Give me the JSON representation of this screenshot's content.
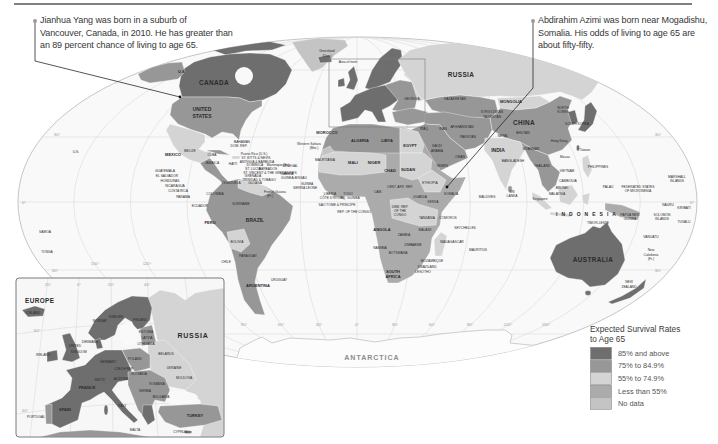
{
  "callouts": [
    {
      "lines": [
        "Jianhua Yang was born in a suburb of",
        "Vancouver, Canada, in 2010. He has greater than",
        "an 89 percent chance of living to age 65."
      ]
    },
    {
      "lines": [
        "Abdirahim Azimi was born near Mogadishu,",
        "Somalia. His odds of living to age 65 are",
        "about fifty-fifty."
      ]
    }
  ],
  "legend": {
    "title_line1": "Expected Survival Rates",
    "title_line2": "to Age 65",
    "items": [
      {
        "label": "85% and above",
        "color": "#6e6e6e"
      },
      {
        "label": "75% to 84.9%",
        "color": "#979797"
      },
      {
        "label": "55% to 74.9%",
        "color": "#d4d4d4"
      },
      {
        "label": "Less than 55%",
        "color": "#ababab"
      },
      {
        "label": "No data",
        "color": "#c4c4c4"
      }
    ]
  },
  "map": {
    "degree_labels": [
      "30°",
      "0°",
      "30°",
      "150°",
      "120°",
      "30°",
      "0°",
      "30°",
      "90°",
      "60°",
      "30°",
      "0°",
      "30°",
      "60°",
      "90°",
      "120°",
      "150°"
    ],
    "labels": {
      "us_alaska": "U.S.",
      "us_hawaii": "U.S.",
      "canada": "CANADA",
      "united_states_1": "UNITED",
      "united_states_2": "STATES",
      "greenland_1": "Greenland",
      "greenland_2": "(Den.)",
      "area_of_inset": "Area of inset",
      "mexico": "MEXICO",
      "belize": "BELIZE",
      "cuba": "CUBA",
      "bahamas": "BAHAMAS",
      "dom_rep": "DOM. REP.",
      "jamaica": "JAMAICA",
      "haiti": "HAITI",
      "puerto_rico": "Puerto Rico (U.S.)",
      "st_kitts": "ST. KITTS & NEVIS",
      "antigua": "ANTIGUA & BARBUDA",
      "dominica": "DOMINICA",
      "martinique": "Martinique (Fr.)",
      "st_lucia": "ST. LUCIA",
      "barbados": "BARBADOS",
      "st_vincent": "ST. VINCENT & THE GRENADINES",
      "grenada": "GRENADA",
      "trinidad": "TRINIDAD & TOBAGO",
      "guatemala": "GUATEMALA",
      "el_salvador": "EL SALVADOR",
      "honduras": "HONDURAS",
      "nicaragua": "NICARAGUA",
      "costa_rica": "COSTA RICA",
      "panama": "PANAMA",
      "colombia": "COLOMBIA",
      "ecuador": "ECUADOR",
      "venezuela": "VENEZUELA",
      "guyana": "GUYANA",
      "suriname": "SURINAME",
      "french_guiana_1": "French Guiana",
      "french_guiana_2": "(Fr.)",
      "peru": "PERU",
      "brazil": "BRAZIL",
      "bolivia": "BOLIVIA",
      "paraguay": "PARAGUAY",
      "chile": "CHILE",
      "uruguay": "URUGUAY",
      "argentina": "ARGENTINA",
      "samoa": "SAMOA",
      "tonga": "TONGA",
      "morocco": "MOROCCO",
      "western_sahara_1": "Western Sahara",
      "western_sahara_2": "(Mor.)",
      "algeria": "ALGERIA",
      "libya": "LIBYA",
      "egypt": "EGYPT",
      "mauritania": "MAURITANIA",
      "mali": "MALI",
      "niger": "NIGER",
      "chad": "CHAD",
      "sudan": "SUDAN",
      "senegal": "SENEGAL",
      "gambia": "GAMBIA",
      "guinea_bissau": "GUINEA-BISSAU",
      "guinea": "GUINEA",
      "sierra_leone": "SIERRA LEONE",
      "liberia": "LIBERIA",
      "cote_divoire": "CÔTE D'IVOIRE",
      "togo": "TOGO",
      "eq_guinea": "EQ. GUINEA",
      "sao_tome": "SAO TOME & PRINCIPE",
      "rep_congo": "REP. OF THE CONGO",
      "cameroon": "CAM.",
      "car": "CENT. AFR. REP.",
      "ethiopia": "ETHIOPIA",
      "somalia": "SOMALIA",
      "uganda": "UGANDA",
      "kenya": "KENYA",
      "drc_1": "DEM. REP.",
      "drc_2": "OF THE",
      "drc_3": "CONGO",
      "tanzania": "TANZANIA",
      "angola": "ANGOLA",
      "zambia": "ZAMBIA",
      "malawi": "MALAWI",
      "namibia": "NAMIBIA",
      "botswana": "BOTSWANA",
      "zimbabwe": "ZIMBABWE",
      "south_africa_1": "SOUTH",
      "south_africa_2": "AFRICA",
      "mozambique": "MOZAMBIQUE",
      "swaziland": "SWAZILAND",
      "lesotho": "LESOTHO",
      "madagascar": "MADAGASCAR",
      "comoros": "COMOROS",
      "seychelles": "SEYCHELLES",
      "mauritius": "MAURITIUS",
      "georgia": "GEORGIA",
      "iraq": "IRAQ",
      "iran": "IRAN",
      "saudi_1": "SAUDI",
      "saudi_2": "ARABIA",
      "yemen": "YEMEN",
      "oman": "OMAN",
      "kazakhstan": "KAZAKHSTAN",
      "afghanistan": "AFGHANISTAN",
      "pakistan": "PAKISTAN",
      "kyrgyzstan": "KYRGYZSTAN",
      "tajikistan": "TAJIKISTAN",
      "mongolia": "MONGOLIA",
      "china": "CHINA",
      "nepal": "NEPAL",
      "bhutan": "BHUTAN",
      "india": "INDIA",
      "bangladesh": "BANGLADESH",
      "myanmar": "MYANMAR",
      "thailand": "THAILAND",
      "vietnam": "VIETNAM",
      "cambodia": "CAMBODIA",
      "brunei": "BRUNEI",
      "malaysia": "MALAYSIA",
      "singapore": "Singapore",
      "sri_lanka_1": "SRI",
      "sri_lanka_2": "LANKA",
      "maldives": "MALDIVES",
      "north_korea_1": "NORTH",
      "north_korea_2": "KOREA",
      "south_korea": "SOUTH KOREA",
      "hong_kong": "Hong Kong",
      "macau": "Macau",
      "taiwan": "Taiwan",
      "philippines": "PHILIPPINES",
      "palau": "PALAU",
      "micronesia_1": "FEDERATED STATES",
      "micronesia_2": "OF MICRONESIA",
      "marshall_1": "MARSHALL",
      "marshall_2": "ISLANDS",
      "nauru": "NAURU",
      "kiribati": "KIRIBATI",
      "indonesia": "INDONESIA",
      "png_1": "PAPUA NEW",
      "png_2": "GUINEA",
      "solomon_1": "SOLOMON",
      "solomon_2": "ISLANDS",
      "tuvalu": "TUVALU",
      "timor_leste": "TIMOR-LESTE",
      "vanuatu": "VANUATU",
      "new_caledonia_1": "New",
      "new_caledonia_2": "Caledonia",
      "new_caledonia_3": "(Fr.)",
      "australia": "AUSTRALIA",
      "new_zealand_1": "NEW",
      "new_zealand_2": "ZEALAND",
      "russia": "RUSSIA",
      "antarctica": "ANTARCTICA"
    }
  },
  "inset": {
    "degree_labels": [
      "20°",
      "0°",
      "20°",
      "40°",
      "60°",
      "40°"
    ],
    "labels": {
      "title": "EUROPE",
      "russia": "RUSSIA",
      "iceland": "ICELAND",
      "norway": "NORWAY",
      "sweden": "SWEDEN",
      "finland": "FINLAND",
      "estonia": "ESTONIA",
      "latvia": "LATVIA",
      "lithuania": "LITHUANIA",
      "denmark": "DENMARK",
      "united_kingdom_1": "UNITED",
      "united_kingdom_2": "KINGDOM",
      "ireland": "IRELAND",
      "germany": "GERMANY",
      "poland": "POLAND",
      "belarus": "BELARUS",
      "ukraine": "UKRAINE",
      "moldova": "MOLDOVA",
      "czech_rep": "CZECH REP.",
      "austria": "AUSTRIA",
      "slovakia": "SLOVAKIA",
      "romania": "ROMANIA",
      "switzerland": "SWITZ.",
      "france": "FRANCE",
      "serbia": "SERBIA",
      "bulgaria": "BULGARIA",
      "italy": "ITALY",
      "spain": "SPAIN",
      "portugal": "PORTUGAL",
      "turkey": "TURKEY",
      "malta": "MALTA",
      "cyprus": "CYPRUS"
    }
  }
}
